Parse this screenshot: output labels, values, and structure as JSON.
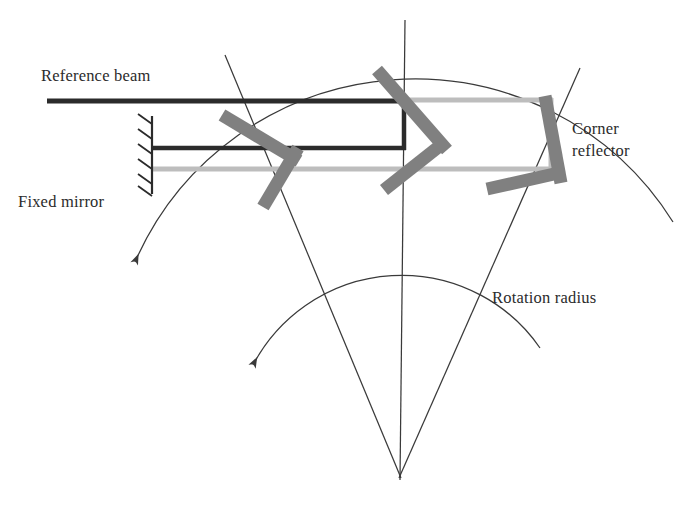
{
  "figure": {
    "type": "optical-ray-diagram",
    "canvas": {
      "width": 699,
      "height": 511,
      "background": "#ffffff"
    }
  },
  "labels": {
    "reference_beam": "Reference beam",
    "fixed_mirror": "Fixed mirror",
    "corner_reflector_line1": "Corner",
    "corner_reflector_line2": "reflector",
    "rotation_radius": "Rotation radius"
  },
  "colors": {
    "dark_beam": "#2b2b2b",
    "light_beam": "#bdbdbd",
    "optic_gray": "#808080",
    "line": "#3a3a3a",
    "text": "#2b2b2b",
    "background": "#ffffff"
  },
  "geometry": {
    "apex": {
      "x": 400,
      "y": 460
    },
    "radial_lines": [
      {
        "name": "left-radial",
        "x1": 225,
        "y1": 55,
        "x2": 400,
        "y2": 478
      },
      {
        "name": "center-radial",
        "x1": 405,
        "y1": 20,
        "x2": 401,
        "y2": 480
      },
      {
        "name": "right-radial",
        "x1": 580,
        "y1": 68,
        "x2": 400,
        "y2": 478
      }
    ],
    "arcs": [
      {
        "name": "outer-rotation-arc",
        "radius": 305,
        "arrow_at": {
          "x": 152,
          "y": 240
        }
      },
      {
        "name": "inner-rotation-arc",
        "radius": 168,
        "arrow_at": {
          "x": 262,
          "y": 357
        }
      }
    ],
    "dark_beams": [
      {
        "name": "reference-beam-line",
        "x1": 47,
        "y1": 101,
        "x2": 405,
        "y2": 101
      },
      {
        "name": "fixed-mirror-beam-line",
        "x1": 152,
        "y1": 148,
        "x2": 405,
        "y2": 148
      },
      {
        "name": "beam-splitter-vertical-link",
        "x1": 404,
        "y1": 101,
        "x2": 404,
        "y2": 148
      }
    ],
    "light_beams": [
      {
        "name": "lower-return-beam",
        "x1": 152,
        "y1": 169,
        "x2": 553,
        "y2": 169
      },
      {
        "name": "upper-return-beam",
        "x1": 405,
        "y1": 100,
        "x2": 553,
        "y2": 100
      },
      {
        "name": "right-vertical-beam",
        "x1": 551,
        "y1": 100,
        "x2": 551,
        "y2": 170
      }
    ],
    "optics": [
      {
        "name": "left-splitter-upper-bar",
        "x1": 222,
        "y1": 113,
        "x2": 300,
        "y2": 160
      },
      {
        "name": "left-splitter-lower-bar",
        "x1": 300,
        "y1": 150,
        "x2": 262,
        "y2": 208
      },
      {
        "name": "center-mirror-upper-bar",
        "x1": 375,
        "y1": 68,
        "x2": 447,
        "y2": 148
      },
      {
        "name": "center-mirror-lower-bar",
        "x1": 447,
        "y1": 140,
        "x2": 383,
        "y2": 190
      },
      {
        "name": "corner-reflector-steep-bar",
        "x1": 545,
        "y1": 96,
        "x2": 562,
        "y2": 182
      },
      {
        "name": "corner-reflector-shallow-bar",
        "x1": 487,
        "y1": 188,
        "x2": 563,
        "y2": 172
      }
    ],
    "fixed_mirror_symbol": {
      "x": 152,
      "y_top": 116,
      "y_bottom": 194,
      "hatch_count": 6
    }
  }
}
